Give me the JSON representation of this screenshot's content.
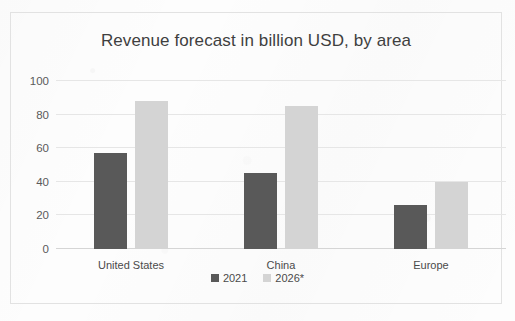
{
  "chart_data": {
    "type": "bar",
    "title": "Revenue forecast in billion USD, by area",
    "xlabel": "",
    "ylabel": "",
    "categories": [
      "United States",
      "China",
      "Europe"
    ],
    "series": [
      {
        "name": "2021",
        "values": [
          57,
          45,
          26
        ],
        "color": "#595959"
      },
      {
        "name": "2026*",
        "values": [
          88,
          85,
          40
        ],
        "color": "#d4d4d4"
      }
    ],
    "ylim": [
      0,
      100
    ],
    "yticks": [
      0,
      20,
      40,
      60,
      80,
      100
    ],
    "ytick_labels": [
      "0",
      "20",
      "40",
      "60",
      "80",
      "100"
    ],
    "grid": true,
    "grid_axis": "y",
    "legend": true,
    "legend_position": "bottom",
    "bar_group_mode": "grouped"
  },
  "colors": {
    "page_background": "#fdfdfd",
    "frame_border": "#e2e2e2",
    "gridline": "#e6e6e6",
    "baseline": "#d5d5d5",
    "title_text": "#3f3f3f",
    "tick_text": "#5a5a5a",
    "category_text": "#4a4a4a"
  }
}
